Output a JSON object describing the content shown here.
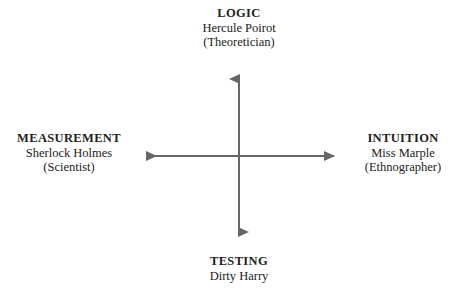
{
  "diagram": {
    "line_color": "#666666",
    "text_color": "#222222",
    "background_color": "#ffffff",
    "axes": [
      {
        "name": "vertical-axis",
        "from_label": "TESTING",
        "to_label": "LOGIC",
        "orientation": "vertical",
        "double_headed": true
      },
      {
        "name": "horizontal-axis",
        "from_label": "MEASUREMENT",
        "to_label": "INTUITION",
        "orientation": "horizontal",
        "double_headed": true
      }
    ],
    "poles": {
      "top": {
        "heading": "LOGIC",
        "person": "Hercule Poirot",
        "role": "(Theoretician)"
      },
      "bottom": {
        "heading": "TESTING",
        "person": "Dirty Harry",
        "role": ""
      },
      "left": {
        "heading": "MEASUREMENT",
        "person": "Sherlock Holmes",
        "role": "(Scientist)"
      },
      "right": {
        "heading": "INTUITION",
        "person": "Miss Marple",
        "role": "(Ethnographer)"
      }
    }
  }
}
